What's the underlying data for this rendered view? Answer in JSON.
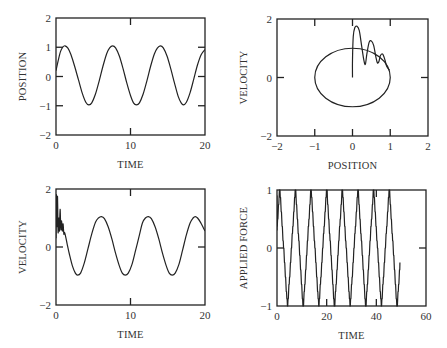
{
  "chart_data": [
    {
      "id": "position-vs-time",
      "type": "line",
      "title": "",
      "xlabel": "TIME",
      "ylabel": "POSITION",
      "xlim": [
        0,
        20
      ],
      "ylim": [
        -2,
        2
      ],
      "xticks": [
        0,
        10,
        20
      ],
      "yticks": [
        -2,
        -1,
        0,
        1,
        2
      ],
      "ytick_labels": [
        "-2",
        "-1",
        "0",
        "1",
        "2"
      ],
      "grid": false,
      "box": {
        "left": 56,
        "right": 205,
        "top": 18,
        "bottom": 135
      },
      "series": [
        {
          "name": "position",
          "x": [
            0,
            0.3,
            0.6,
            0.9,
            1.2,
            1.6,
            2.0,
            2.5,
            3.0,
            3.5,
            4.0,
            4.4,
            4.8,
            5.3,
            5.8,
            6.3,
            6.8,
            7.2,
            7.6,
            8.0,
            8.5,
            9.0,
            9.5,
            10.0,
            10.4,
            10.8,
            11.2,
            11.7,
            12.2,
            12.7,
            13.2,
            13.6,
            14.0,
            14.4,
            14.9,
            15.4,
            15.9,
            16.4,
            16.8,
            17.1,
            17.5,
            18.0,
            18.5,
            19.0,
            19.5,
            20.0
          ],
          "y": [
            0.2,
            0.55,
            0.85,
            1.0,
            1.05,
            0.97,
            0.75,
            0.35,
            -0.1,
            -0.55,
            -0.88,
            -0.97,
            -0.9,
            -0.6,
            -0.15,
            0.35,
            0.78,
            0.98,
            1.05,
            0.98,
            0.7,
            0.27,
            -0.22,
            -0.65,
            -0.9,
            -0.97,
            -0.9,
            -0.6,
            -0.15,
            0.35,
            0.77,
            0.97,
            1.05,
            0.98,
            0.7,
            0.27,
            -0.22,
            -0.68,
            -0.9,
            -0.97,
            -0.88,
            -0.55,
            -0.08,
            0.4,
            0.75,
            0.92
          ]
        }
      ]
    },
    {
      "id": "velocity-vs-position",
      "type": "line",
      "title": "",
      "xlabel": "POSITION",
      "ylabel": "VELOCITY",
      "xlim": [
        -2,
        2
      ],
      "ylim": [
        -2,
        2
      ],
      "xticks": [
        -2,
        -1,
        0,
        1,
        2
      ],
      "xtick_labels": [
        "-2",
        "-1",
        "0",
        "1",
        "2"
      ],
      "yticks": [
        -2,
        0,
        2
      ],
      "ytick_labels": [
        "-2",
        "0",
        "2"
      ],
      "grid": false,
      "box": {
        "left": 277,
        "right": 428,
        "top": 19,
        "bottom": 136
      },
      "series": [
        {
          "name": "limit cycle",
          "shape": "ellipse",
          "cx": 0,
          "cy": 0,
          "rx": 1.0,
          "ry": 1.0
        },
        {
          "name": "transient",
          "x": [
            0,
            0,
            0.02,
            0.06,
            0.12,
            0.18,
            0.24,
            0.3,
            0.34,
            0.38,
            0.44,
            0.5,
            0.56,
            0.62,
            0.66,
            0.7,
            0.74,
            0.8,
            0.86,
            0.9,
            0.95,
            0.98
          ],
          "y": [
            0,
            0.6,
            1.4,
            1.7,
            1.75,
            1.6,
            1.1,
            0.6,
            0.45,
            0.8,
            1.2,
            1.25,
            1.1,
            0.7,
            0.5,
            0.55,
            0.75,
            0.8,
            0.6,
            0.4,
            0.3,
            0.25
          ]
        }
      ]
    },
    {
      "id": "velocity-vs-time",
      "type": "line",
      "title": "",
      "xlabel": "TIME",
      "ylabel": "VELOCITY",
      "xlim": [
        0,
        20
      ],
      "ylim": [
        -2,
        2
      ],
      "xticks": [
        0,
        10,
        20
      ],
      "yticks": [
        -2,
        0,
        2
      ],
      "ytick_labels": [
        "-2",
        "0",
        "2"
      ],
      "grid": false,
      "box": {
        "left": 56,
        "right": 205,
        "top": 189,
        "bottom": 305
      },
      "series": [
        {
          "name": "velocity",
          "x": [
            0,
            0.05,
            0.12,
            0.2,
            0.28,
            0.36,
            0.45,
            0.55,
            0.65,
            0.75,
            0.85,
            0.95,
            1.05,
            1.15,
            1.3,
            1.5,
            1.8,
            2.2,
            2.6,
            2.9,
            3.3,
            3.8,
            4.3,
            4.8,
            5.3,
            5.7,
            6.1,
            6.5,
            7.0,
            7.5,
            8.0,
            8.5,
            8.9,
            9.3,
            9.7,
            10.2,
            10.7,
            11.2,
            11.6,
            12.0,
            12.4,
            12.8,
            13.3,
            13.8,
            14.3,
            14.8,
            15.2,
            15.6,
            16.0,
            16.5,
            17.0,
            17.5,
            18.0,
            18.4,
            18.7,
            19.0,
            19.4,
            19.8,
            20.0
          ],
          "y": [
            0.3,
            1.8,
            0.7,
            1.75,
            0.5,
            1.0,
            0.55,
            1.3,
            0.6,
            0.9,
            0.55,
            0.8,
            0.45,
            0.5,
            0.35,
            0.1,
            -0.25,
            -0.65,
            -0.9,
            -0.97,
            -0.9,
            -0.55,
            -0.05,
            0.45,
            0.85,
            1.0,
            1.05,
            0.98,
            0.7,
            0.28,
            -0.22,
            -0.65,
            -0.9,
            -0.97,
            -0.9,
            -0.6,
            -0.1,
            0.42,
            0.83,
            1.0,
            1.05,
            0.98,
            0.7,
            0.28,
            -0.22,
            -0.65,
            -0.9,
            -0.97,
            -0.9,
            -0.6,
            -0.1,
            0.42,
            0.83,
            1.0,
            1.05,
            1.0,
            0.85,
            0.65,
            0.55
          ]
        }
      ]
    },
    {
      "id": "applied-force-vs-time",
      "type": "line",
      "title": "",
      "xlabel": "TIME",
      "ylabel": "APPLIED FORCE",
      "xlim": [
        0,
        60
      ],
      "ylim": [
        -1,
        1
      ],
      "xticks": [
        0,
        20,
        40,
        60
      ],
      "yticks": [
        -1,
        0,
        1
      ],
      "ytick_labels": [
        "-1",
        "0",
        "1"
      ],
      "grid": false,
      "box": {
        "left": 277,
        "right": 426,
        "top": 190,
        "bottom": 306
      },
      "series": [
        {
          "name": "applied force",
          "period": 6.3,
          "phase_peak": 1.1,
          "t_start": 0,
          "t_end": 49.5,
          "amplitude": 1.0,
          "end_value": -0.25,
          "start_value": 0.3
        }
      ]
    }
  ],
  "figure": {
    "panel_count": 4,
    "layout": "2x2",
    "line_color": "#222222",
    "background": "#ffffff"
  }
}
